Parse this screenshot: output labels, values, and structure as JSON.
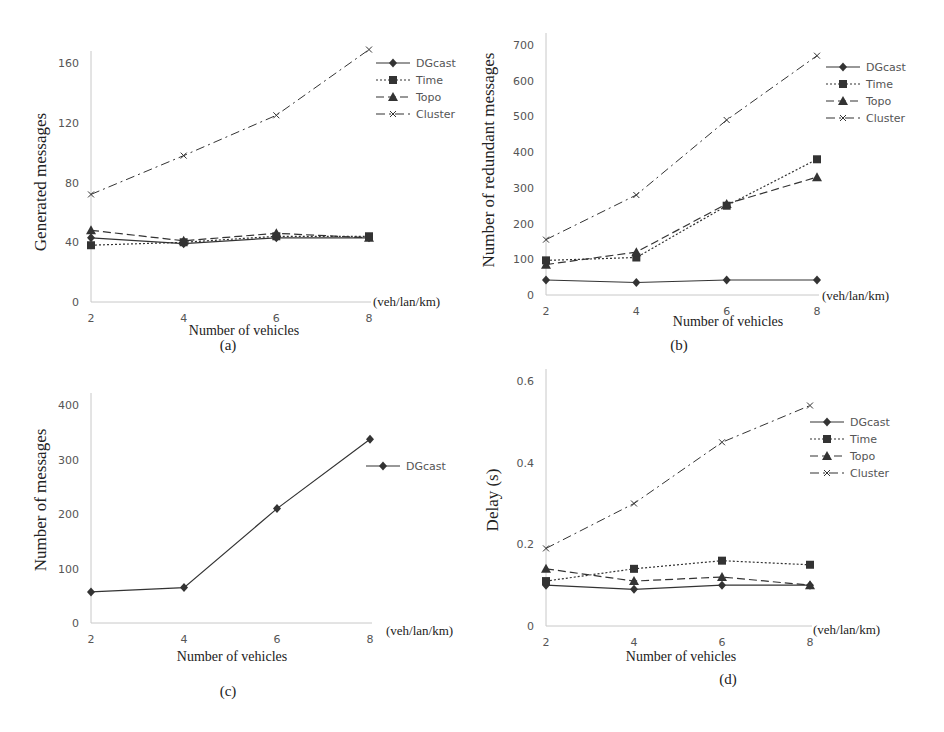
{
  "chart_data": [
    {
      "id": "a",
      "type": "line",
      "panel_label": "(a)",
      "title": "",
      "xlabel": "Number of vehicles",
      "x_unit": "(veh/lan/km)",
      "ylabel": "Generated messages",
      "x": [
        2,
        4,
        6,
        8
      ],
      "xticks": [
        "2",
        "4",
        "6",
        "8"
      ],
      "yticks": [
        "0",
        "40",
        "80",
        "120",
        "160"
      ],
      "ylim": [
        0,
        160
      ],
      "grid": false,
      "legend_position": "upper right",
      "series": [
        {
          "name": "DGcast",
          "style": "solid",
          "marker": "diamond",
          "values": [
            43,
            39,
            43,
            43
          ]
        },
        {
          "name": "Time",
          "style": "dotted",
          "marker": "square",
          "values": [
            38,
            40,
            44,
            44
          ]
        },
        {
          "name": "Topo",
          "style": "dashed",
          "marker": "triangle",
          "values": [
            48,
            41,
            46,
            43
          ]
        },
        {
          "name": "Cluster",
          "style": "dashdot",
          "marker": "x",
          "values": [
            72,
            98,
            125,
            169
          ]
        }
      ]
    },
    {
      "id": "b",
      "type": "line",
      "panel_label": "(b)",
      "title": "",
      "xlabel": "Number of vehicles",
      "x_unit": "(veh/lan/km)",
      "ylabel": "Number of redundant messages",
      "x": [
        2,
        4,
        6,
        8
      ],
      "xticks": [
        "2",
        "4",
        "6",
        "8"
      ],
      "yticks": [
        "0",
        "100",
        "200",
        "300",
        "400",
        "500",
        "600",
        "700"
      ],
      "ylim": [
        0,
        700
      ],
      "grid": false,
      "legend_position": "upper right",
      "series": [
        {
          "name": "DGcast",
          "style": "solid",
          "marker": "diamond",
          "values": [
            42,
            35,
            42,
            42
          ]
        },
        {
          "name": "Time",
          "style": "dotted",
          "marker": "square",
          "values": [
            97,
            105,
            250,
            380
          ]
        },
        {
          "name": "Topo",
          "style": "dashed",
          "marker": "triangle",
          "values": [
            85,
            120,
            255,
            330
          ]
        },
        {
          "name": "Cluster",
          "style": "dashdot",
          "marker": "x",
          "values": [
            155,
            280,
            490,
            670
          ]
        }
      ]
    },
    {
      "id": "c",
      "type": "line",
      "panel_label": "(c)",
      "title": "",
      "xlabel": "Number of vehicles",
      "x_unit": "(veh/lan/km)",
      "ylabel": "Number of messages",
      "x": [
        2,
        4,
        6,
        8
      ],
      "xticks": [
        "2",
        "4",
        "6",
        "8"
      ],
      "yticks": [
        "0",
        "100",
        "200",
        "300",
        "400"
      ],
      "ylim": [
        0,
        400
      ],
      "grid": false,
      "legend_position": "right",
      "series": [
        {
          "name": "DGcast",
          "style": "solid",
          "marker": "diamond",
          "values": [
            57,
            65,
            210,
            337
          ]
        }
      ]
    },
    {
      "id": "d",
      "type": "line",
      "panel_label": "(d)",
      "title": "",
      "xlabel": "Number of vehicles",
      "x_unit": "(veh/lan/km)",
      "ylabel": "Delay (s)",
      "x": [
        2,
        4,
        6,
        8
      ],
      "xticks": [
        "2",
        "4",
        "6",
        "8"
      ],
      "yticks": [
        "0",
        "0.2",
        "0.4",
        "0.6"
      ],
      "ylim": [
        0,
        0.6
      ],
      "grid": false,
      "legend_position": "upper right",
      "series": [
        {
          "name": "DGcast",
          "style": "solid",
          "marker": "diamond",
          "values": [
            0.1,
            0.09,
            0.1,
            0.1
          ]
        },
        {
          "name": "Time",
          "style": "dotted",
          "marker": "square",
          "values": [
            0.11,
            0.14,
            0.16,
            0.15
          ]
        },
        {
          "name": "Topo",
          "style": "dashed",
          "marker": "triangle",
          "values": [
            0.14,
            0.11,
            0.12,
            0.1
          ]
        },
        {
          "name": "Cluster",
          "style": "dashdot",
          "marker": "x",
          "values": [
            0.19,
            0.3,
            0.45,
            0.54
          ]
        }
      ]
    }
  ],
  "layout": {
    "panels": [
      {
        "id": "a",
        "x0": 91,
        "x1": 369,
        "y0": 302,
        "y1": 63,
        "legend": [
          376,
          63
        ],
        "ylabel_x": 46,
        "ylabel_y": 182,
        "label_pos": [
          228,
          350
        ],
        "xlabel_pos": [
          244,
          335
        ],
        "unit_pos": [
          373,
          306
        ]
      },
      {
        "id": "b",
        "x0": 546,
        "x1": 817,
        "y0": 295,
        "y1": 45,
        "legend": [
          826,
          67
        ],
        "ylabel_x": 494,
        "ylabel_y": 160,
        "label_pos": [
          679,
          350
        ],
        "xlabel_pos": [
          728,
          326
        ],
        "unit_pos": [
          822,
          300
        ]
      },
      {
        "id": "c",
        "x0": 91,
        "x1": 370,
        "y0": 623,
        "y1": 405,
        "legend": [
          366,
          466
        ],
        "ylabel_x": 46,
        "ylabel_y": 500,
        "label_pos": [
          228,
          696
        ],
        "xlabel_pos": [
          232,
          661
        ],
        "unit_pos": [
          386,
          635
        ]
      },
      {
        "id": "d",
        "x0": 546,
        "x1": 810,
        "y0": 626,
        "y1": 381,
        "legend": [
          810,
          422
        ],
        "ylabel_x": 498,
        "ylabel_y": 500,
        "label_pos": [
          728,
          684
        ],
        "xlabel_pos": [
          681,
          661
        ],
        "unit_pos": [
          813,
          634
        ]
      }
    ],
    "colors": {
      "axis": "#c8c8c8",
      "series": "#333333",
      "tick_text": "#555555",
      "label_text": "#222222"
    }
  }
}
